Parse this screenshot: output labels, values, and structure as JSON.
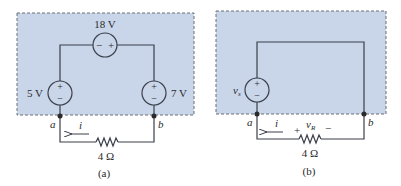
{
  "colors": {
    "shade": "#c9d6ea",
    "wire": "#3a3f4a",
    "text": "#2a2a2a",
    "border_dash": "#6a6f78"
  },
  "panel_a": {
    "caption": "(a)",
    "top_source": {
      "label": "18 V",
      "minus": "−",
      "plus": "+"
    },
    "left_source": {
      "label": "5 V",
      "plus": "+",
      "minus": "−"
    },
    "right_source": {
      "label": "7 V",
      "plus": "+",
      "minus": "−"
    },
    "node_a": "a",
    "node_b": "b",
    "current": "i",
    "resistor": "4 Ω"
  },
  "panel_b": {
    "caption": "(b)",
    "source": {
      "label": "v",
      "subscript": "s",
      "plus": "+",
      "minus": "−"
    },
    "node_a": "a",
    "node_b": "b",
    "current": "i",
    "resistor": "4 Ω",
    "resistor_voltage": {
      "label": "v",
      "subscript": "R",
      "plus": "+",
      "minus": "−"
    }
  }
}
